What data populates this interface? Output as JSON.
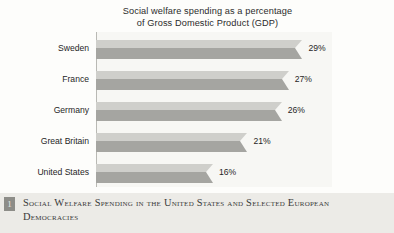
{
  "chart_data": {
    "type": "bar",
    "orientation": "horizontal",
    "title": "Social welfare spending as a percentage of Gross Domestic Product (GDP)",
    "title_lines": [
      "Social welfare spending as a percentage",
      "of Gross Domestic Product (GDP)"
    ],
    "categories": [
      "Sweden",
      "France",
      "Germany",
      "Great Britain",
      "United States"
    ],
    "values": [
      29,
      27,
      26,
      21,
      16
    ],
    "value_labels": [
      "29%",
      "27%",
      "26%",
      "21%",
      "16%"
    ],
    "xlabel": "",
    "ylabel": "",
    "xlim": [
      0,
      32
    ],
    "grid": false,
    "legend": false,
    "series_color": "#a5a5a1",
    "series_highlight_color": "#cfcfcb"
  },
  "caption": {
    "marker": "1",
    "text": "Social Welfare Spending in the United States and Selected European Democracies"
  }
}
